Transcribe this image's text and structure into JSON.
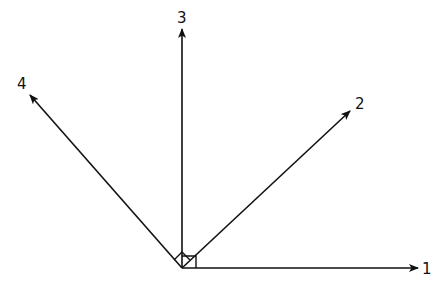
{
  "diagram": {
    "type": "vector-diagram",
    "origin": {
      "x": 182,
      "y": 268
    },
    "stroke_color": "#111111",
    "background": "#ffffff",
    "vectors": [
      {
        "id": "1",
        "label": "1",
        "tip": {
          "x": 418,
          "y": 268
        },
        "label_pos": {
          "x": 422,
          "y": 274
        }
      },
      {
        "id": "2",
        "label": "2",
        "tip": {
          "x": 350,
          "y": 111
        },
        "label_pos": {
          "x": 355,
          "y": 109
        }
      },
      {
        "id": "3",
        "label": "3",
        "tip": {
          "x": 182,
          "y": 29
        },
        "label_pos": {
          "x": 177,
          "y": 23
        }
      },
      {
        "id": "4",
        "label": "4",
        "tip": {
          "x": 30,
          "y": 95
        },
        "label_pos": {
          "x": 17,
          "y": 89
        }
      }
    ],
    "right_angle_markers": [
      {
        "name": "right-angle-square-1-3",
        "between": [
          "1",
          "3"
        ]
      },
      {
        "name": "right-angle-diamond-2-4",
        "between": [
          "2",
          "4"
        ]
      }
    ]
  }
}
